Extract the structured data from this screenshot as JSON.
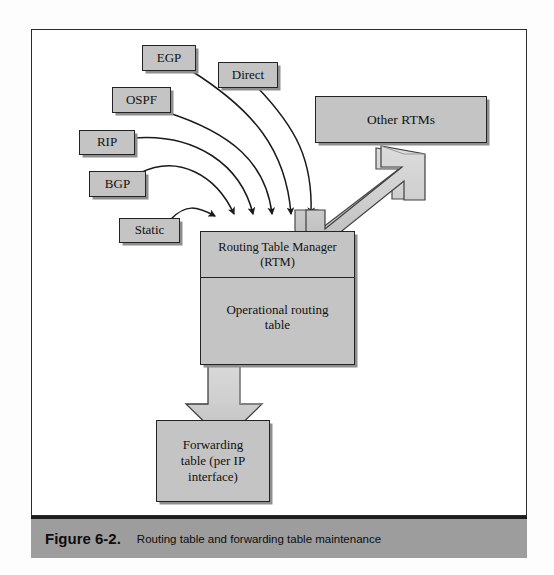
{
  "figure": {
    "caption_label": "Figure 6-2.",
    "caption_text": "Routing table and forwarding table maintenance"
  },
  "diagram": {
    "type": "block-flow-diagram",
    "title": "Routing table and forwarding table maintenance",
    "source_boxes": [
      {
        "id": "egp",
        "label": "EGP",
        "x": 142,
        "y": 45,
        "w": 54,
        "h": 26
      },
      {
        "id": "direct",
        "label": "Direct",
        "x": 218,
        "y": 62,
        "w": 60,
        "h": 26
      },
      {
        "id": "ospf",
        "label": "OSPF",
        "x": 112,
        "y": 87,
        "w": 59,
        "h": 26
      },
      {
        "id": "rip",
        "label": "RIP",
        "x": 79,
        "y": 130,
        "w": 56,
        "h": 25
      },
      {
        "id": "bgp",
        "label": "BGP",
        "x": 89,
        "y": 171,
        "w": 57,
        "h": 26
      },
      {
        "id": "static",
        "label": "Static",
        "x": 119,
        "y": 218,
        "w": 61,
        "h": 25
      }
    ],
    "peer_box": {
      "id": "other-rtms",
      "label": "Other RTMs",
      "x": 315,
      "y": 96,
      "w": 172,
      "h": 47
    },
    "rtm_box": {
      "id": "rtm",
      "header_line1": "Routing Table Manager",
      "header_line2": "(RTM)",
      "body_line1": "Operational routing",
      "body_line2": "table",
      "x": 200,
      "y": 231,
      "w": 155,
      "h": 134
    },
    "forwarding_box": {
      "id": "forwarding",
      "line1": "Forwarding",
      "line2": "table (per IP",
      "line3": "interface)",
      "x": 156,
      "y": 420,
      "w": 114,
      "h": 82
    },
    "connectors": {
      "curved_arrow_count": 6,
      "curved_arrow_sources": [
        "Static",
        "BGP",
        "RIP",
        "OSPF",
        "EGP",
        "Direct"
      ],
      "curved_arrow_target": "Routing Table Manager (RTM)",
      "block_arrow_bidirectional": {
        "from": "Routing Table Manager (RTM)",
        "to": "Other RTMs",
        "direction": "both"
      },
      "block_arrow_down": {
        "from": "Operational routing table",
        "to": "Forwarding table (per IP interface)",
        "direction": "down"
      }
    },
    "colors": {
      "box_fill": "#c4c4c4",
      "box_border": "#232323",
      "box_shadow": "#8e8e8e",
      "block_arrow_fill": "#cfcfcf",
      "caption_bar": "#9d9d9d",
      "page_background": "#ffffff",
      "line": "#1a1a1a"
    }
  }
}
